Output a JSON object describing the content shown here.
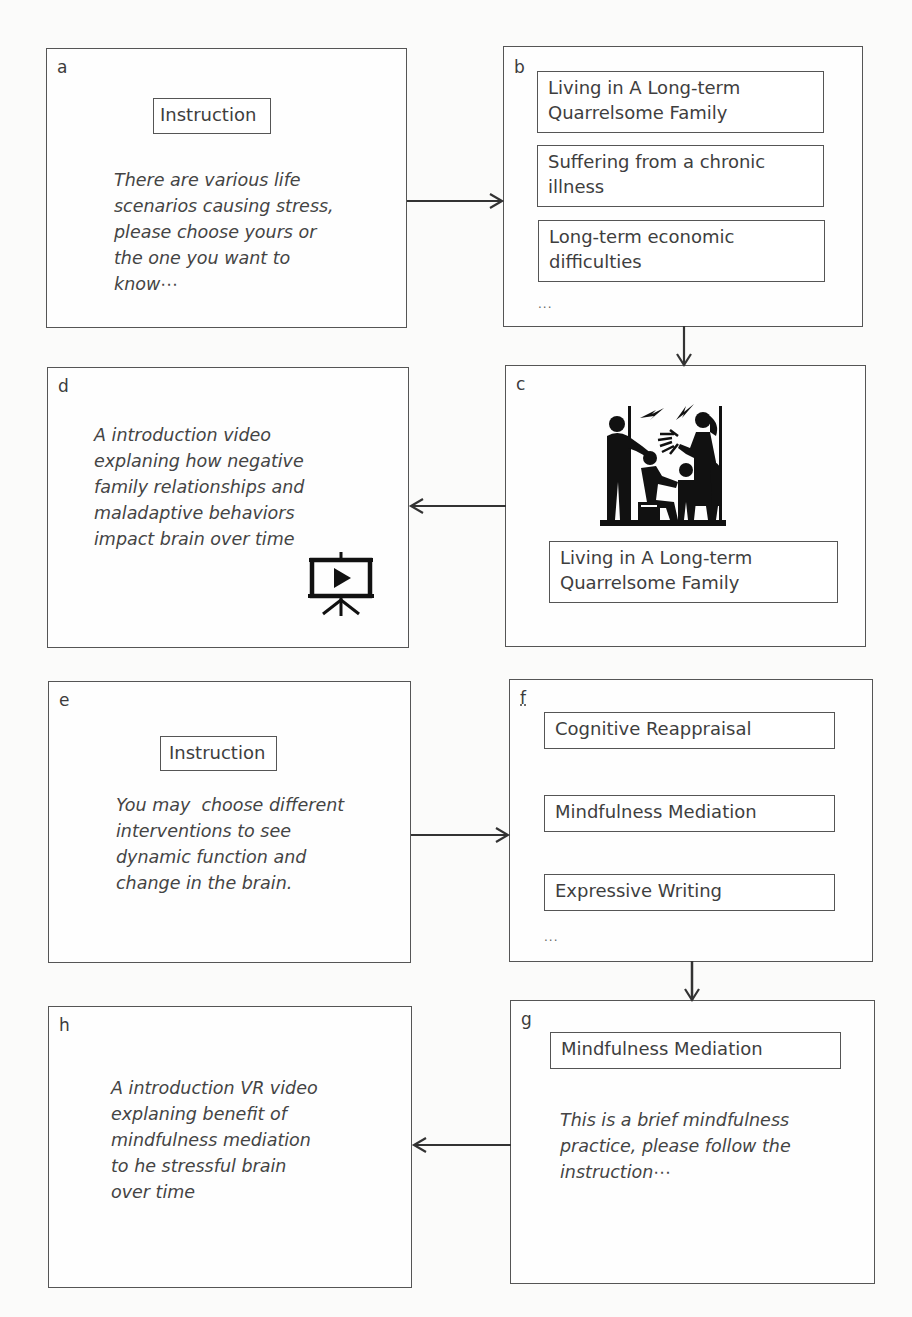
{
  "panels": {
    "a": {
      "letter": "a",
      "label": "Instruction",
      "text_lines": [
        "There are various life",
        "scenarios causing stress,",
        "please choose yours or",
        "the one you want to",
        "know⋯"
      ]
    },
    "b": {
      "letter": "b",
      "options": [
        {
          "lines": [
            "Living in A Long-term",
            "Quarrelsome Family"
          ]
        },
        {
          "lines": [
            "Suffering from a chronic",
            "illness"
          ]
        },
        {
          "lines": [
            "Long-term economic",
            "difficulties"
          ]
        }
      ],
      "ellipsis": "..."
    },
    "c": {
      "letter": "c",
      "image_icon": "quarrelling-family-icon",
      "label_lines": [
        "Living in A Long-term",
        "Quarrelsome Family"
      ]
    },
    "d": {
      "letter": "d",
      "text_lines": [
        "A introduction video",
        "explaning how negative",
        "family relationships and",
        "maladaptive behaviors",
        "impact brain over time"
      ],
      "icon": "video-presentation-icon"
    },
    "e": {
      "letter": "e",
      "label": "Instruction",
      "text_lines": [
        "You may  choose different",
        "interventions to see",
        "dynamic function and",
        "change in the brain."
      ]
    },
    "f": {
      "letter": "f",
      "options": [
        "Cognitive Reappraisal",
        "Mindfulness Mediation",
        "Expressive Writing"
      ],
      "ellipsis": "..."
    },
    "g": {
      "letter": "g",
      "label": "Mindfulness Mediation",
      "text_lines": [
        "This is a brief mindfulness",
        "practice, please follow the",
        "instruction⋯"
      ]
    },
    "h": {
      "letter": "h",
      "text_lines": [
        "A introduction VR video",
        "explaning benefit of",
        "mindfulness mediation",
        "to he stressful brain",
        "over time"
      ]
    }
  },
  "colors": {
    "stroke": "#555555",
    "text": "#3e3e3e",
    "icon": "#111111"
  }
}
